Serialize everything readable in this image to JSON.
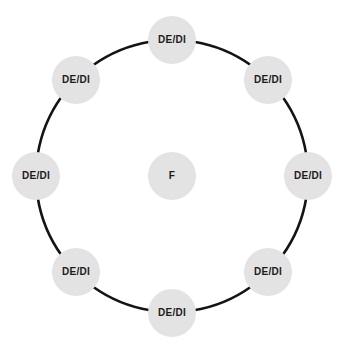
{
  "diagram": {
    "type": "ring-network",
    "background_color": "#ffffff",
    "node_fill_color": "#e3e3e3",
    "node_text_color": "#1c1c1c",
    "ring_stroke_color": "#141414",
    "ring_stroke_width": 2.6,
    "ring": {
      "center_x": 172,
      "center_y": 176,
      "radius": 136
    },
    "center_node": {
      "label": "F",
      "name": "center-node-f",
      "cx": 172,
      "cy": 176,
      "r": 24
    },
    "outer_nodes": [
      {
        "label": "DE/DI",
        "name": "node-de-di-top",
        "cx": 172,
        "cy": 40,
        "r": 24,
        "angle": 270
      },
      {
        "label": "DE/DI",
        "name": "node-de-di-top-right",
        "cx": 268,
        "cy": 80,
        "r": 24,
        "angle": 315
      },
      {
        "label": "DE/DI",
        "name": "node-de-di-right",
        "cx": 308,
        "cy": 176,
        "r": 24,
        "angle": 0
      },
      {
        "label": "DE/DI",
        "name": "node-de-di-bottom-right",
        "cx": 268,
        "cy": 272,
        "r": 24,
        "angle": 45
      },
      {
        "label": "DE/DI",
        "name": "node-de-di-bottom",
        "cx": 172,
        "cy": 313,
        "r": 24,
        "angle": 90
      },
      {
        "label": "DE/DI",
        "name": "node-de-di-bottom-left",
        "cx": 76,
        "cy": 272,
        "r": 24,
        "angle": 135
      },
      {
        "label": "DE/DI",
        "name": "node-de-di-left",
        "cx": 36,
        "cy": 176,
        "r": 24,
        "angle": 180
      },
      {
        "label": "DE/DI",
        "name": "node-de-di-top-left",
        "cx": 76,
        "cy": 80,
        "r": 24,
        "angle": 225
      }
    ]
  }
}
